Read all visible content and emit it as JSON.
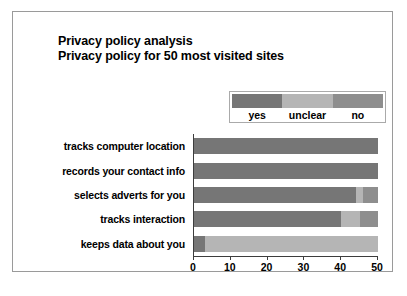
{
  "chart_data": {
    "type": "bar",
    "orientation": "horizontal",
    "stacked": true,
    "title": "Privacy policy analysis",
    "subtitle": "Privacy policy for 50 most visited sites",
    "xlabel": "",
    "ylabel": "",
    "xlim": [
      0,
      50
    ],
    "xticks": [
      0,
      10,
      20,
      30,
      40,
      50
    ],
    "xtick_labels": [
      "0",
      "10",
      "20",
      "30",
      "40",
      "50"
    ],
    "grid": false,
    "legend_position": "top-right",
    "categories": [
      "tracks computer location",
      "records your contact info",
      "selects adverts for you",
      "tracks interaction",
      "keeps data about you"
    ],
    "series": [
      {
        "name": "yes",
        "color": "#767676",
        "values": [
          50,
          50,
          44,
          40,
          3
        ]
      },
      {
        "name": "unclear",
        "color": "#b5b5b5",
        "values": [
          0,
          0,
          2,
          5,
          47
        ]
      },
      {
        "name": "no",
        "color": "#8e8e8e",
        "values": [
          0,
          0,
          4,
          5,
          0
        ]
      }
    ]
  },
  "legend": {
    "entries": [
      {
        "label": "yes",
        "color": "#767676"
      },
      {
        "label": "unclear",
        "color": "#b5b5b5"
      },
      {
        "label": "no",
        "color": "#8e8e8e"
      }
    ]
  },
  "frame": {
    "border_color": "#9a9a9a",
    "axis_color": "#3d3d3d",
    "background": "#ffffff"
  }
}
